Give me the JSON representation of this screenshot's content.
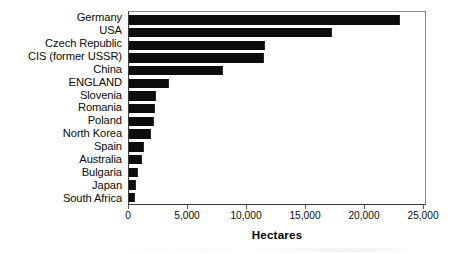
{
  "chart_data": {
    "type": "bar",
    "orientation": "horizontal",
    "title": "",
    "subtitle": "",
    "xlabel": "Hectares",
    "ylabel": "",
    "categories": [
      "Germany",
      "USA",
      "Czech Republic",
      "CIS (former USSR)",
      "China",
      "ENGLAND",
      "Slovenia",
      "Romania",
      "Poland",
      "North Korea",
      "Spain",
      "Australia",
      "Bulgaria",
      "Japan",
      "South Africa"
    ],
    "values": [
      23000,
      17200,
      11500,
      11400,
      8000,
      3400,
      2300,
      2200,
      2100,
      1900,
      1300,
      1100,
      800,
      600,
      550
    ],
    "xlim": [
      0,
      25250
    ],
    "xticks": [
      0,
      5000,
      10000,
      15000,
      20000,
      25000
    ],
    "xticklabels": [
      "0",
      "5,000",
      "10,000",
      "15,000",
      "20,000",
      "25,000"
    ],
    "grid": false,
    "legend": null,
    "bar_color": "#0d0d0d",
    "frame_color": "#3a3a3a",
    "background": "#ffffff"
  }
}
